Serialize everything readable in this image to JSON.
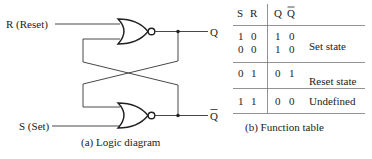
{
  "logic_diagram": {
    "inputs": {
      "reset_label": "R (Reset)",
      "set_label": "S (Set)"
    },
    "outputs": {
      "q_label": "Q",
      "qbar_label": "Q"
    },
    "gates": [
      {
        "type": "NOR",
        "position": "top",
        "inputs": [
          "R",
          "Q-bar feedback"
        ],
        "output": "Q"
      },
      {
        "type": "NOR",
        "position": "bottom",
        "inputs": [
          "Q feedback",
          "S"
        ],
        "output": "Q-bar"
      }
    ],
    "caption": "(a) Logic diagram"
  },
  "function_table": {
    "headers": {
      "s": "S",
      "r": "R",
      "q": "Q",
      "qbar": "Q"
    },
    "groups": [
      {
        "rows": [
          {
            "s": "1",
            "r": "0",
            "q": "1",
            "qbar": "0"
          },
          {
            "s": "0",
            "r": "0",
            "q": "1",
            "qbar": "0"
          }
        ],
        "description": "Set state"
      },
      {
        "rows": [
          {
            "s": "0",
            "r": "1",
            "q": "0",
            "qbar": "1"
          },
          {
            "s": "0",
            "r": "0",
            "q": "0",
            "qbar": "1"
          }
        ],
        "description": "Reset state"
      },
      {
        "rows": [
          {
            "s": "1",
            "r": "1",
            "q": "0",
            "qbar": "0"
          }
        ],
        "description": "Undefined"
      }
    ],
    "caption": "(b) Function table"
  }
}
